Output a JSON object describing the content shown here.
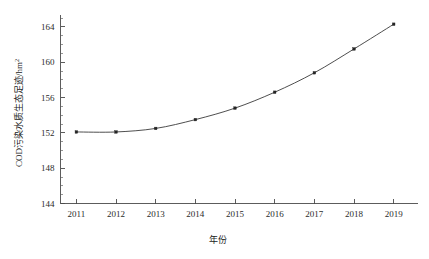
{
  "chart_data": {
    "type": "line",
    "title": "",
    "subtitle": "",
    "xlabel": "年份",
    "ylabel": "COD污染水质生态足迹/hm²",
    "ylabel_base": "COD污染水质生态足迹/hm",
    "ylabel_exponent": "2",
    "categories": [
      2011,
      2012,
      2013,
      2014,
      2015,
      2016,
      2017,
      2018,
      2019
    ],
    "x": [
      2011,
      2012,
      2013,
      2014,
      2015,
      2016,
      2017,
      2018,
      2019
    ],
    "values": [
      152.1,
      152.1,
      152.5,
      153.5,
      154.8,
      156.6,
      158.8,
      161.5,
      164.3
    ],
    "series": [
      {
        "name": "COD污染水质生态足迹",
        "values": [
          152.1,
          152.1,
          152.5,
          153.5,
          154.8,
          156.6,
          158.8,
          161.5,
          164.3
        ]
      }
    ],
    "xlim": [
      2010.6,
      2019.6
    ],
    "ylim": [
      144,
      165.4
    ],
    "ytick_labels": [
      "144",
      "148",
      "152",
      "156",
      "160",
      "164"
    ],
    "yticks": [
      144,
      148,
      152,
      156,
      160,
      164
    ],
    "ytick_minor_step": 1,
    "xtick_labels": [
      "2011",
      "2012",
      "2013",
      "2014",
      "2015",
      "2016",
      "2017",
      "2018",
      "2019"
    ],
    "grid": false,
    "legend": false,
    "legend_position": "none",
    "marker": "square",
    "line_color": "#3a3a3a",
    "marker_color": "#242424",
    "axis_color": "#4a4a4a",
    "background_color": "#ffffff"
  }
}
